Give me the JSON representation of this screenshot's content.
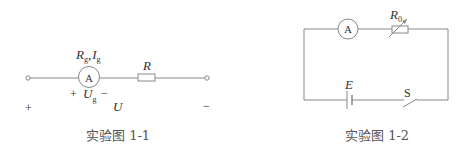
{
  "figure1": {
    "caption": "实验图 1-1",
    "meter_label": "A",
    "meter_params_R": "R",
    "meter_params_R_sub": "g",
    "meter_params_sep": ",",
    "meter_params_I": "I",
    "meter_params_I_sub": "g",
    "resistor_label": "R",
    "meter_plus": "+",
    "meter_voltage": "U",
    "meter_voltage_sub": "g",
    "meter_minus": "−",
    "terminal_plus": "+",
    "total_voltage": "U",
    "terminal_minus": "−"
  },
  "figure2": {
    "caption": "实验图 1-2",
    "meter_label": "A",
    "rheostat_label": "R",
    "rheostat_sub": "0",
    "battery_label": "E",
    "switch_label": "S"
  },
  "colors": {
    "line": "#888888",
    "text": "#333333",
    "caption": "#555555"
  }
}
